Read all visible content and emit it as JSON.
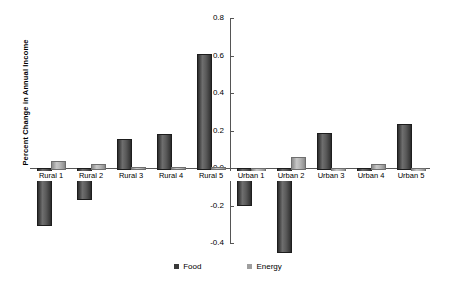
{
  "chart_data": {
    "type": "bar",
    "title": "",
    "xlabel": "",
    "ylabel": "Percent Change in Annual Income",
    "ylim": [
      -0.4,
      0.8
    ],
    "ytick_labels": [
      "0.8",
      "0.6",
      "0.4",
      "0.2",
      "0.0",
      "-0.2",
      "-0.4"
    ],
    "ytick_values": [
      0.8,
      0.6,
      0.4,
      0.2,
      0.0,
      -0.2,
      -0.4
    ],
    "grid": false,
    "legend_position": "bottom-center",
    "categories": [
      "Rural 1",
      "Rural 2",
      "Rural 3",
      "Rural 4",
      "Rural 5",
      "Urban 1",
      "Urban 2",
      "Urban 3",
      "Urban 4",
      "Urban 5"
    ],
    "series": [
      {
        "name": "Food",
        "color": "#3a3a3a",
        "values": [
          -0.3,
          -0.16,
          0.155,
          0.18,
          0.61,
          -0.19,
          -0.44,
          0.185,
          -0.025,
          0.235
        ]
      },
      {
        "name": "Energy",
        "color": "#9f9f9f",
        "values": [
          0.04,
          0.02,
          0.0,
          0.0,
          0.005,
          -0.015,
          0.06,
          -0.01,
          0.02,
          -0.02
        ]
      }
    ]
  },
  "legend": {
    "items": [
      {
        "label": "Food"
      },
      {
        "label": "Energy"
      }
    ]
  }
}
